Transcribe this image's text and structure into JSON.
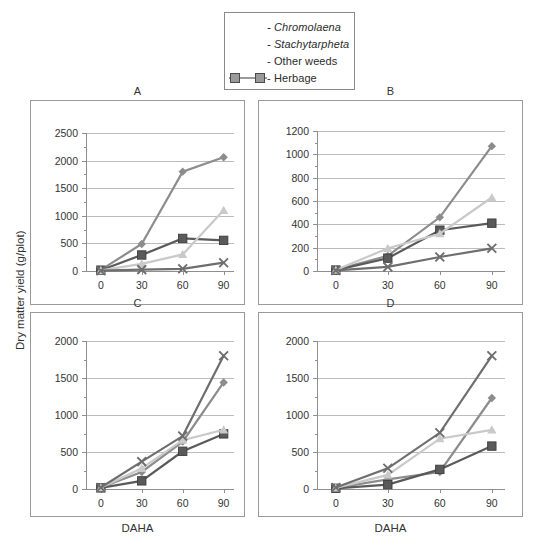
{
  "figure": {
    "yaxis_title": "Dry matter yield (g/plot)",
    "xaxis_title": "DAHA"
  },
  "legend": {
    "items": [
      {
        "label": "- Chromolaena",
        "italic": true,
        "icon": "diamond-marker",
        "color": "#808080"
      },
      {
        "label": "- Stachytarpheta",
        "italic": true,
        "icon": "square-marker",
        "color": "#555555"
      },
      {
        "label": "- Other weeds",
        "italic": false,
        "icon": "triangle-marker",
        "color": "#c0c0c0"
      },
      {
        "label": "- Herbage",
        "italic": false,
        "icon": "square-marker",
        "color": "#9a9a9a"
      }
    ]
  },
  "chart_data": [
    {
      "type": "line",
      "title": "A",
      "xlabel": "DAHA",
      "ylabel": "Dry matter yield (g/plot)",
      "x": [
        0,
        30,
        60,
        90
      ],
      "xticks": [
        "0",
        "30",
        "60",
        "90"
      ],
      "yticks": [
        "0",
        "500",
        "1000",
        "1500",
        "2000",
        "2500"
      ],
      "ylim": [
        0,
        2500
      ],
      "grid": true,
      "series": [
        {
          "name": "Chromolaena",
          "marker": "diamond",
          "color": "#8c8c8c",
          "values": [
            20,
            490,
            1800,
            2060
          ]
        },
        {
          "name": "Stachytarpheta",
          "marker": "square",
          "color": "#5a5a5a",
          "values": [
            15,
            290,
            590,
            555
          ]
        },
        {
          "name": "Other weeds",
          "marker": "triangle",
          "color": "#c9c9c9",
          "values": [
            10,
            130,
            300,
            1100
          ]
        },
        {
          "name": "Herbage",
          "marker": "x",
          "color": "#6e6e6e",
          "values": [
            5,
            25,
            40,
            150
          ]
        }
      ]
    },
    {
      "type": "line",
      "title": "B",
      "xlabel": "DAHA",
      "ylabel": "Dry matter yield (g/plot)",
      "x": [
        0,
        30,
        60,
        90
      ],
      "xticks": [
        "0",
        "30",
        "60",
        "90"
      ],
      "yticks": [
        "0",
        "200",
        "400",
        "600",
        "800",
        "1000",
        "1200"
      ],
      "ylim": [
        0,
        1200
      ],
      "grid": true,
      "series": [
        {
          "name": "Chromolaena",
          "marker": "diamond",
          "color": "#8c8c8c",
          "values": [
            10,
            130,
            460,
            1070
          ]
        },
        {
          "name": "Stachytarpheta",
          "marker": "square",
          "color": "#5a5a5a",
          "values": [
            8,
            110,
            350,
            410
          ]
        },
        {
          "name": "Other weeds",
          "marker": "triangle",
          "color": "#c9c9c9",
          "values": [
            8,
            195,
            320,
            630
          ]
        },
        {
          "name": "Herbage",
          "marker": "x",
          "color": "#6e6e6e",
          "values": [
            5,
            35,
            120,
            195
          ]
        }
      ]
    },
    {
      "type": "line",
      "title": "C",
      "xlabel": "DAHA",
      "ylabel": "Dry matter yield (g/plot)",
      "x": [
        0,
        30,
        60,
        90
      ],
      "xticks": [
        "0",
        "30",
        "60",
        "90"
      ],
      "yticks": [
        "0",
        "500",
        "1000",
        "1500",
        "2000"
      ],
      "ylim": [
        0,
        2000
      ],
      "grid": true,
      "series": [
        {
          "name": "Chromolaena",
          "marker": "diamond",
          "color": "#8c8c8c",
          "values": [
            20,
            230,
            640,
            1440
          ]
        },
        {
          "name": "Stachytarpheta",
          "marker": "square",
          "color": "#5a5a5a",
          "values": [
            15,
            110,
            510,
            745
          ]
        },
        {
          "name": "Other weeds",
          "marker": "triangle",
          "color": "#c9c9c9",
          "values": [
            18,
            280,
            660,
            800
          ]
        },
        {
          "name": "Herbage",
          "marker": "x",
          "color": "#6e6e6e",
          "values": [
            20,
            370,
            715,
            1800
          ]
        }
      ]
    },
    {
      "type": "line",
      "title": "D",
      "xlabel": "DAHA",
      "ylabel": "Dry matter yield (g/plot)",
      "x": [
        0,
        30,
        60,
        90
      ],
      "xticks": [
        "0",
        "30",
        "60",
        "90"
      ],
      "yticks": [
        "0",
        "500",
        "1000",
        "1500",
        "2000"
      ],
      "ylim": [
        0,
        2000
      ],
      "grid": true,
      "series": [
        {
          "name": "Chromolaena",
          "marker": "diamond",
          "color": "#8c8c8c",
          "values": [
            15,
            130,
            230,
            1230
          ]
        },
        {
          "name": "Stachytarpheta",
          "marker": "square",
          "color": "#5a5a5a",
          "values": [
            10,
            60,
            265,
            580
          ]
        },
        {
          "name": "Other weeds",
          "marker": "triangle",
          "color": "#c9c9c9",
          "values": [
            15,
            190,
            680,
            800
          ]
        },
        {
          "name": "Herbage",
          "marker": "x",
          "color": "#6e6e6e",
          "values": [
            20,
            280,
            760,
            1800
          ]
        }
      ]
    }
  ]
}
